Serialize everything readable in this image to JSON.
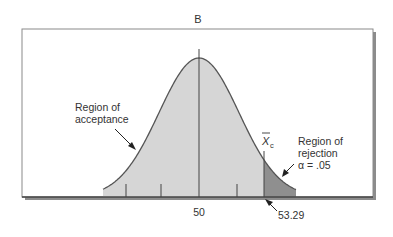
{
  "chart_data": {
    "type": "area",
    "title": "B",
    "xlabel": "",
    "ylabel": "",
    "distribution": "normal",
    "mean": 50,
    "critical_value": 53.29,
    "alpha": 0.05,
    "tick_labels": [
      {
        "value": 50,
        "label": "50"
      },
      {
        "value": 53.29,
        "label": "53.29"
      }
    ],
    "regions": [
      {
        "name": "Region of acceptance",
        "range": [
          "-inf",
          53.29
        ],
        "shade": "light"
      },
      {
        "name": "Region of rejection",
        "range": [
          53.29,
          "inf"
        ],
        "shade": "dark",
        "annotation": "α = .05"
      }
    ],
    "annotations": [
      {
        "text": "Region of acceptance",
        "target": "acceptance area"
      },
      {
        "text": "Region of rejection α = .05",
        "target": "rejection tail"
      },
      {
        "text": "X̄c",
        "target": "critical line"
      },
      {
        "text": "53.29",
        "target": "critical value on x-axis"
      }
    ],
    "grid": false,
    "legend": "none"
  },
  "labels": {
    "title": "B",
    "acceptance_line1": "Region of",
    "acceptance_line2": "acceptance",
    "rejection_line1": "Region of",
    "rejection_line2": "rejection",
    "rejection_line3": "α = .05",
    "critical_symbol": "X",
    "critical_subscript": "c",
    "mean_tick": "50",
    "critical_tick": "53.29"
  },
  "colors": {
    "acceptance_fill": "#d6d6d6",
    "rejection_fill": "#8f8f8f",
    "curve": "#555555",
    "frame": "#8a8a8a",
    "shadow": "#8c8c8c",
    "text": "#333333"
  }
}
